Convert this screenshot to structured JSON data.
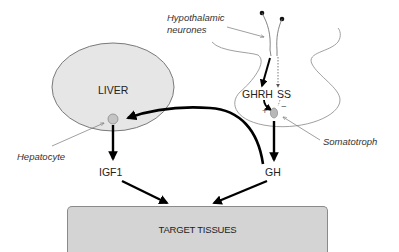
{
  "diagram": {
    "title": "",
    "labels": {
      "hypothalamic_neurones_line1": "Hypothalamic",
      "hypothalamic_neurones_line2": "neurones",
      "liver": "LIVER",
      "hepatocyte": "Hepatocyte",
      "igf1": "IGF1",
      "ghrh": "GHRH",
      "ss": "SS",
      "plus": "+",
      "minus": "−",
      "somatotroph": "Somatotroph",
      "gh": "GH",
      "target_tissues": "TARGET TISSUES"
    },
    "nodes": [
      {
        "id": "hypothalamic-neurones",
        "label": "Hypothalamic neurones"
      },
      {
        "id": "ghrh",
        "label": "GHRH"
      },
      {
        "id": "ss",
        "label": "SS"
      },
      {
        "id": "somatotroph",
        "label": "Somatotroph"
      },
      {
        "id": "gh",
        "label": "GH"
      },
      {
        "id": "liver",
        "label": "LIVER"
      },
      {
        "id": "hepatocyte",
        "label": "Hepatocyte"
      },
      {
        "id": "igf1",
        "label": "IGF1"
      },
      {
        "id": "target-tissues",
        "label": "TARGET TISSUES"
      }
    ],
    "edges": [
      {
        "from": "hypothalamic-neurones",
        "to": "ghrh",
        "style": "solid"
      },
      {
        "from": "hypothalamic-neurones",
        "to": "ss",
        "style": "dashed"
      },
      {
        "from": "ghrh",
        "to": "somatotroph",
        "style": "solid",
        "effect": "+"
      },
      {
        "from": "ss",
        "to": "somatotroph",
        "style": "dashed",
        "effect": "-"
      },
      {
        "from": "somatotroph",
        "to": "gh",
        "style": "solid"
      },
      {
        "from": "gh",
        "to": "hepatocyte",
        "style": "solid"
      },
      {
        "from": "hepatocyte",
        "to": "igf1",
        "style": "solid"
      },
      {
        "from": "igf1",
        "to": "target-tissues",
        "style": "solid"
      },
      {
        "from": "gh",
        "to": "target-tissues",
        "style": "solid"
      }
    ],
    "colors": {
      "liver_fill": "#e6e6e6",
      "cell_fill": "#c4c4c4",
      "target_fill": "#d4d4d4",
      "arrow": "#000000",
      "outline": "#7a7a7a"
    }
  }
}
